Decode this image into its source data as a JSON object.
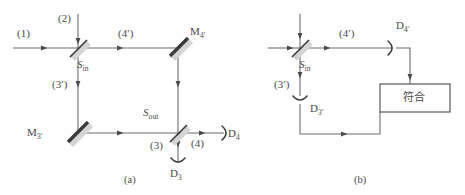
{
  "figure": {
    "panels": [
      {
        "id": "panel-a",
        "caption": "(a)",
        "beam_labels": {
          "input_1": "(1)",
          "input_2": "(2)",
          "path_3prime": "(3′)",
          "path_4prime": "(4′)",
          "output_3": "(3)",
          "output_4": "(4)"
        },
        "components": {
          "splitter_in": "S",
          "splitter_in_sub": "in",
          "splitter_out": "S",
          "splitter_out_sub": "out",
          "mirror_3prime": "M",
          "mirror_3prime_sub": "3′",
          "mirror_4prime": "M",
          "mirror_4prime_sub": "4′",
          "detector_3": "D",
          "detector_3_sub": "3",
          "detector_4": "D",
          "detector_4_sub": "4"
        }
      },
      {
        "id": "panel-b",
        "caption": "(b)",
        "beam_labels": {
          "path_3prime": "(3′)",
          "path_4prime": "(4′)"
        },
        "components": {
          "splitter_in": "S",
          "splitter_in_sub": "in",
          "detector_3prime": "D",
          "detector_3prime_sub": "3′",
          "detector_4prime": "D",
          "detector_4prime_sub": "4′",
          "coincidence_box": "符合"
        }
      }
    ],
    "colors": {
      "line": "#6e6e6e",
      "line_dark": "#3a3a3a",
      "text": "#4a4a4a",
      "background": "#ffffff",
      "shadow": "#d9d9d9"
    }
  }
}
